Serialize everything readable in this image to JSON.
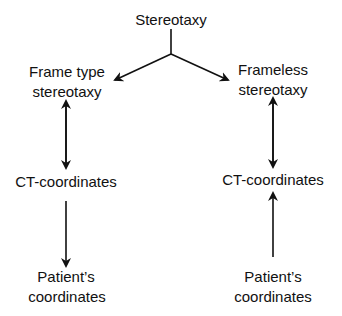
{
  "diagram": {
    "root": {
      "label": "Stereotaxy"
    },
    "left_branch": {
      "title_line1": "Frame type",
      "title_line2": "stereotaxy",
      "middle": "CT-coordinates",
      "bottom_line1": "Patient’s",
      "bottom_line2": "coordinates"
    },
    "right_branch": {
      "title_line1": "Frameless",
      "title_line2": "stereotaxy",
      "middle": "CT-coordinates",
      "bottom_line1": "Patient’s",
      "bottom_line2": "coordinates"
    },
    "edges": [
      {
        "from": "Stereotaxy",
        "to": "Frame type stereotaxy",
        "type": "arrow"
      },
      {
        "from": "Stereotaxy",
        "to": "Frameless stereotaxy",
        "type": "arrow"
      },
      {
        "from": "Frame type stereotaxy",
        "to": "CT-coordinates (left)",
        "type": "bidirectional"
      },
      {
        "from": "CT-coordinates (left)",
        "to": "Patient's coordinates (left)",
        "type": "arrow"
      },
      {
        "from": "Frameless stereotaxy",
        "to": "CT-coordinates (right)",
        "type": "bidirectional"
      },
      {
        "from": "Patient's coordinates (right)",
        "to": "CT-coordinates (right)",
        "type": "arrow"
      }
    ],
    "colors": {
      "line": "#111111",
      "background": "#ffffff"
    }
  }
}
